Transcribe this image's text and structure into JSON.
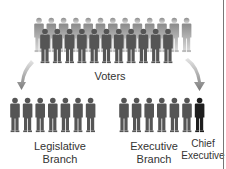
{
  "diagram": {
    "title": "",
    "nodes": {
      "voters": {
        "label": "Voters",
        "back_row_count": 13,
        "front_row_count": 11
      },
      "legislative": {
        "label_line1": "Legislative",
        "label_line2": "Branch",
        "count": 7
      },
      "executive": {
        "label_line1": "Executive",
        "label_line2": "Branch",
        "count": 6
      },
      "chief": {
        "label_line1": "Chief",
        "label_line2": "Executive",
        "count": 1
      }
    },
    "edges": [
      {
        "from": "voters",
        "to": "legislative"
      },
      {
        "from": "voters",
        "to": "chief"
      }
    ],
    "colors": {
      "figure": "#555555",
      "figure_back": "#9a9a9a",
      "chief": "#1e1e1e",
      "arrow": "#888888",
      "text": "#333333"
    }
  }
}
